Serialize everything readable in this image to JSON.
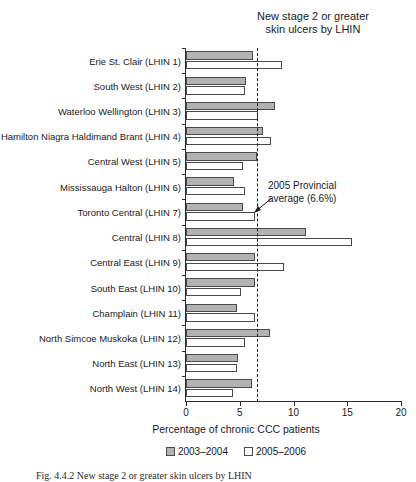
{
  "chart_data": {
    "type": "bar",
    "orientation": "horizontal",
    "title": "New stage 2 or greater skin ulcers by LHIN",
    "title_lines": [
      "New stage 2 or greater",
      "skin ulcers by LHIN"
    ],
    "xlabel": "Percentage of chronic CCC patients",
    "ylabel": "",
    "xlim": [
      0,
      20
    ],
    "xticks": [
      0,
      5,
      10,
      15,
      20
    ],
    "xtick_labels": [
      "0",
      "5",
      "10",
      "15",
      "20"
    ],
    "grid": false,
    "legend_position": "bottom",
    "categories": [
      "Erie St. Clair (LHIN 1)",
      "South West (LHIN 2)",
      "Waterloo Wellington (LHIN 3)",
      "Hamilton Niagra Haldimand Brant (LHIN 4)",
      "Central West (LHIN 5)",
      "Mississauga Halton (LHIN 6)",
      "Toronto Central (LHIN 7)",
      "Central (LHIN 8)",
      "Central East (LHIN 9)",
      "South East (LHIN 10)",
      "Champlain (LHIN 11)",
      "North Simcoe Muskoka (LHIN 12)",
      "North East (LHIN 13)",
      "North West (LHIN 14)"
    ],
    "series": [
      {
        "name": "2003–2004",
        "color": "#b2b2b2",
        "values": [
          6.2,
          5.6,
          8.3,
          7.2,
          6.6,
          4.5,
          5.3,
          11.2,
          6.4,
          6.4,
          4.7,
          7.8,
          4.8,
          6.1
        ]
      },
      {
        "name": "2005–2006",
        "color": "#ffffff",
        "values": [
          8.9,
          5.5,
          6.7,
          7.9,
          5.3,
          5.5,
          6.4,
          15.4,
          9.1,
          5.1,
          6.4,
          5.5,
          4.7,
          4.4
        ]
      }
    ],
    "annotations": [
      {
        "text": "2005 Provincial average (6.6%)",
        "lines": [
          "2005 Provincial",
          "average (6.6%)"
        ],
        "value": 6.6,
        "style": "dashed-vertical-line-with-arrow"
      }
    ]
  },
  "legend": {
    "items": [
      {
        "label": "2003–2004",
        "swatch": "filled-gray"
      },
      {
        "label": "2005–2006",
        "swatch": "open-white"
      }
    ]
  },
  "caption": {
    "text": "Fig. 4.4.2  New stage 2 or greater skin ulcers by LHIN"
  }
}
